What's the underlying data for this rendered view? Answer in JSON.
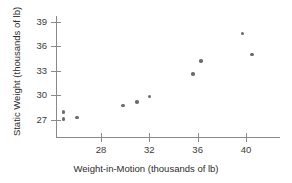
{
  "chart_data": {
    "type": "scatter",
    "title": "",
    "xlabel": "Weight-in-Motion (thousands of lb)",
    "ylabel": "Static Weight (thousands of lb)",
    "xlim": [
      24.0,
      42.5
    ],
    "ylim": [
      25.8,
      39.8
    ],
    "xticks": [
      28,
      32,
      36,
      40
    ],
    "yticks": [
      27,
      30,
      33,
      36,
      39
    ],
    "xtick_labels": [
      "28",
      "32",
      "36",
      "40"
    ],
    "ytick_labels": [
      "27",
      "30",
      "33",
      "36",
      "39"
    ],
    "grid": false,
    "legend": null,
    "marker_color": "#6b6b6b",
    "axis_color": "#8a8a8a",
    "points": [
      {
        "x": 24.9,
        "y": 28.0
      },
      {
        "x": 24.9,
        "y": 27.1
      },
      {
        "x": 26.0,
        "y": 27.3
      },
      {
        "x": 29.8,
        "y": 28.8
      },
      {
        "x": 31.0,
        "y": 29.2
      },
      {
        "x": 32.0,
        "y": 29.9
      },
      {
        "x": 35.6,
        "y": 32.6
      },
      {
        "x": 36.3,
        "y": 34.2
      },
      {
        "x": 39.7,
        "y": 37.6
      },
      {
        "x": 40.5,
        "y": 35.0
      }
    ]
  },
  "geometry": {
    "x_ref_value": 28,
    "x_ref_px": 101,
    "x_px_per_unit": 12.0833,
    "y_ref_value": 27,
    "y_ref_px": 120,
    "y_px_per_unit": 8.1667
  }
}
